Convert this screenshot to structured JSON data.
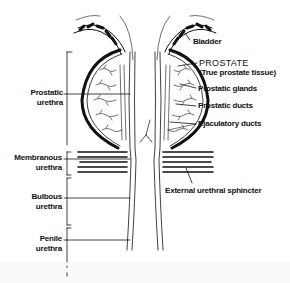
{
  "diagram": {
    "left_labels": [
      {
        "line1": "Prostatic",
        "line2": "urethra"
      },
      {
        "line1": "Membranous",
        "line2": "urethra"
      },
      {
        "line1": "Bulbous",
        "line2": "urethra"
      },
      {
        "line1": "Penile",
        "line2": "urethra"
      }
    ],
    "right_labels": [
      {
        "text": "Bladder"
      },
      {
        "text": "PROSTATE",
        "sub": "(True prostate tissue)"
      },
      {
        "text": "Prostatic glands"
      },
      {
        "text": "Prostatic ducts"
      },
      {
        "text": "Ejaculatory ducts"
      },
      {
        "text": "External urethral sphincter"
      }
    ],
    "colors": {
      "ink": "#111111",
      "background": "#ffffff"
    }
  }
}
